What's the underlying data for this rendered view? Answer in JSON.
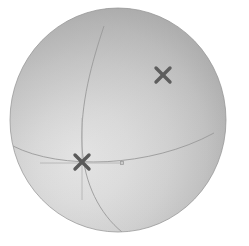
{
  "canvas": {
    "width": 249,
    "height": 246,
    "background_color": "#ffffff",
    "title": "Shaded sphere with great-circle arcs and cross markers"
  },
  "sphere": {
    "name": "sphere-body",
    "center_x": 118,
    "center_y": 120,
    "radius_x": 108,
    "radius_y": 112,
    "bounds": {
      "left": 10,
      "top": 8,
      "right": 226,
      "bottom": 232
    },
    "fill_light_color": "#e2e2e2",
    "fill_mid_color": "#c3c3c3",
    "fill_dark_color": "#9a9a9a",
    "edge_color": "#8e8e8e",
    "highlight_center_x_pct": 36,
    "highlight_center_y_pct": 62
  },
  "arcs": [
    {
      "name": "meridian-arc",
      "label": "meridian great circle",
      "color": "#9a9a9a",
      "stroke_width": 0.9,
      "path": "M 104 26 C 92 62 80 104 82 146 C 84 184 100 214 122 232"
    },
    {
      "name": "equator-arc",
      "label": "equator great circle",
      "color": "#9a9a9a",
      "stroke_width": 0.9,
      "path": "M 13 146 C 60 170 150 168 214 133"
    }
  ],
  "axis_lines": [
    {
      "name": "axis-line-horizontal",
      "color": "#b0b0b0",
      "stroke_width": 0.8,
      "x1": 40,
      "y1": 163,
      "x2": 124,
      "y2": 163
    },
    {
      "name": "axis-line-vertical",
      "color": "#b0b0b0",
      "stroke_width": 0.8,
      "x1": 82,
      "y1": 118,
      "x2": 82,
      "y2": 200
    }
  ],
  "axis_tip_marker": {
    "name": "axis-tip-marker",
    "label": "axis direction tip",
    "color": "#9d9d9d",
    "x": 122,
    "y": 163,
    "size": 3
  },
  "markers": [
    {
      "name": "cross-marker-lower-left",
      "label": "×",
      "color": "#5a5a5a",
      "center_x": 82,
      "center_y": 162,
      "arm": 7,
      "stroke_width": 3.4
    },
    {
      "name": "cross-marker-upper-right",
      "label": "×",
      "color": "#5e5e5e",
      "center_x": 163,
      "center_y": 75,
      "arm": 7,
      "stroke_width": 3.4
    }
  ]
}
